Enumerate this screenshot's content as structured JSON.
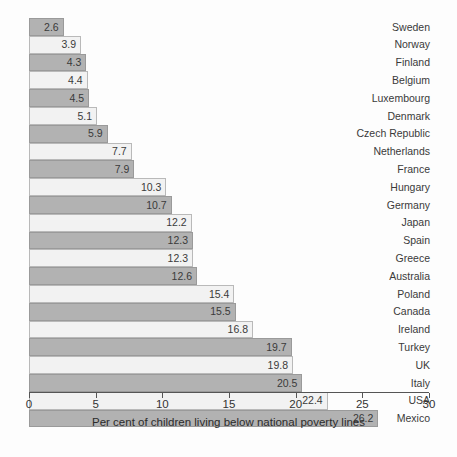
{
  "chart_data": {
    "type": "bar",
    "orientation": "horizontal",
    "title": "",
    "xlabel": "Per cent of children living below national poverty lines",
    "ylabel": "",
    "xlim": [
      0,
      30
    ],
    "xticks": [
      0,
      5,
      10,
      15,
      20,
      25,
      30
    ],
    "grid": false,
    "legend": "none",
    "categories": [
      "Sweden",
      "Norway",
      "Finland",
      "Belgium",
      "Luxembourg",
      "Denmark",
      "Czech Republic",
      "Netherlands",
      "France",
      "Hungary",
      "Germany",
      "Japan",
      "Spain",
      "Greece",
      "Australia",
      "Poland",
      "Canada",
      "Ireland",
      "Turkey",
      "UK",
      "Italy",
      "USA",
      "Mexico"
    ],
    "values": [
      2.6,
      3.9,
      4.3,
      4.4,
      4.5,
      5.1,
      5.9,
      7.7,
      7.9,
      10.3,
      10.7,
      12.2,
      12.3,
      12.3,
      12.6,
      15.4,
      15.5,
      16.8,
      19.7,
      19.8,
      20.5,
      22.4,
      26.2
    ],
    "value_labels": [
      "2.6",
      "3.9",
      "4.3",
      "4.4",
      "4.5",
      "5.1",
      "5.9",
      "7.7",
      "7.9",
      "10.3",
      "10.7",
      "12.2",
      "12.3",
      "12.3",
      "12.6",
      "15.4",
      "15.5",
      "16.8",
      "19.7",
      "19.8",
      "20.5",
      "22.4",
      "26.2"
    ],
    "tick_labels": [
      "0",
      "5",
      "10",
      "15",
      "20",
      "25",
      "30"
    ],
    "colors": {
      "bar_dark": "#b2b2b2",
      "bar_light": "#f2f2f2",
      "bar_border": "#9a9a9a",
      "axis": "#555555",
      "text": "#333333",
      "background": "#fdfdfd"
    }
  }
}
